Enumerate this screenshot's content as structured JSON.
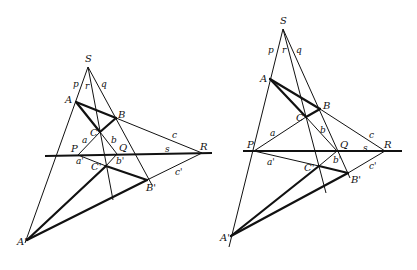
{
  "diagram": {
    "left": {
      "labels": {
        "S": "S",
        "p": "p",
        "r": "r",
        "q": "q",
        "A": "A",
        "B": "B",
        "C": "C",
        "a": "a",
        "b": "b",
        "c": "c",
        "P": "P",
        "Q": "Q",
        "R": "R",
        "s": "s",
        "a_prime": "a'",
        "b_prime": "b'",
        "c_prime": "c'",
        "A_prime": "A'",
        "B_prime": "B'",
        "C_prime": "C'"
      }
    },
    "right": {
      "labels": {
        "S": "S",
        "p": "p",
        "r": "r",
        "q": "q",
        "A": "A",
        "B": "B",
        "C": "C",
        "a": "a",
        "b": "b",
        "c": "c",
        "P": "P",
        "Q": "Q",
        "R": "R",
        "s": "s",
        "a_prime": "a'",
        "b_prime": "b'",
        "c_prime": "c'",
        "A_prime": "A'",
        "B_prime": "B'",
        "C_prime": "C'"
      }
    }
  }
}
